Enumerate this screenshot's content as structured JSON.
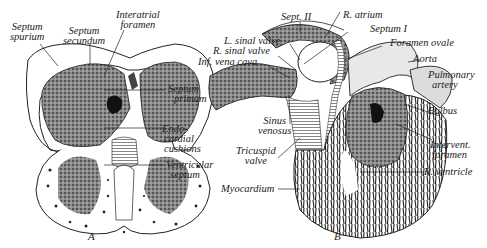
{
  "figure": {
    "panels": [
      {
        "id": "A",
        "caption": "A",
        "labels": [
          {
            "key": "septum_spurium",
            "text": "Septum\nspurium"
          },
          {
            "key": "septum_secundum",
            "text": "Septum\nsecundum"
          },
          {
            "key": "interatrial_foramen",
            "text": "Interatrial\nforamen"
          },
          {
            "key": "septum_primum",
            "text": "Septum\nprimum"
          },
          {
            "key": "endocardial_cushions",
            "text": "Endo-\ncardial\ncushions"
          },
          {
            "key": "ventricular_septum",
            "text": "Ventricular\nseptum"
          }
        ]
      },
      {
        "id": "B",
        "caption": "B",
        "labels": [
          {
            "key": "sept_ii",
            "text": "Sept. II"
          },
          {
            "key": "r_atrium",
            "text": "R. atrium"
          },
          {
            "key": "septum_i",
            "text": "Septum I"
          },
          {
            "key": "foramen_ovale",
            "text": "Foramen ovale"
          },
          {
            "key": "l_sinal_valve",
            "text": "L. sinal valve"
          },
          {
            "key": "r_sinal_valve",
            "text": "R. sinal valve"
          },
          {
            "key": "inf_vena_cava",
            "text": "Inf. vena cava"
          },
          {
            "key": "aorta",
            "text": "Aorta"
          },
          {
            "key": "pulmonary_artery",
            "text": "Pulmonary\nartery"
          },
          {
            "key": "bulbus",
            "text": "Bulbus"
          },
          {
            "key": "sinus_venosus",
            "text": "Sinus\nvenosus"
          },
          {
            "key": "tricuspid_valve",
            "text": "Tricuspid\nvalve"
          },
          {
            "key": "intervent_foramen",
            "text": "Intervent.\nforamen"
          },
          {
            "key": "myocardium",
            "text": "Myocardium"
          },
          {
            "key": "r_ventricle",
            "text": "R. ventricle"
          }
        ]
      }
    ]
  },
  "A": {
    "caption": "A",
    "septum_spurium_1": "Septum",
    "septum_spurium_2": "spurium",
    "septum_secundum_1": "Septum",
    "septum_secundum_2": "secundum",
    "interatrial_1": "Interatrial",
    "interatrial_2": "foramen",
    "septum_primum_1": "Septum",
    "septum_primum_2": "primum",
    "endo_1": "Endo-",
    "endo_2": "cardial",
    "endo_3": "cushions",
    "vent_1": "Ventricular",
    "vent_2": "septum"
  },
  "B": {
    "caption": "B",
    "sept_ii": "Sept. II",
    "r_atrium": "R. atrium",
    "septum_i": "Septum I",
    "foramen_ovale": "Foramen ovale",
    "l_sinal": "L. sinal valve",
    "r_sinal": "R. sinal valve",
    "ivc": "Inf. vena cava",
    "aorta": "Aorta",
    "pulm_1": "Pulmonary",
    "pulm_2": "artery",
    "bulbus": "Bulbus",
    "sinus_1": "Sinus",
    "sinus_2": "venosus",
    "tric_1": "Tricuspid",
    "tric_2": "valve",
    "intervent_1": "Intervent.",
    "intervent_2": "foramen",
    "myocardium": "Myocardium",
    "r_ventricle": "R. ventricle"
  },
  "colors": {
    "ink": "#222222",
    "shade": "#6a6a6a",
    "dark": "#2b2b2b",
    "light": "#d8d8d8",
    "bg": "#ffffff"
  }
}
